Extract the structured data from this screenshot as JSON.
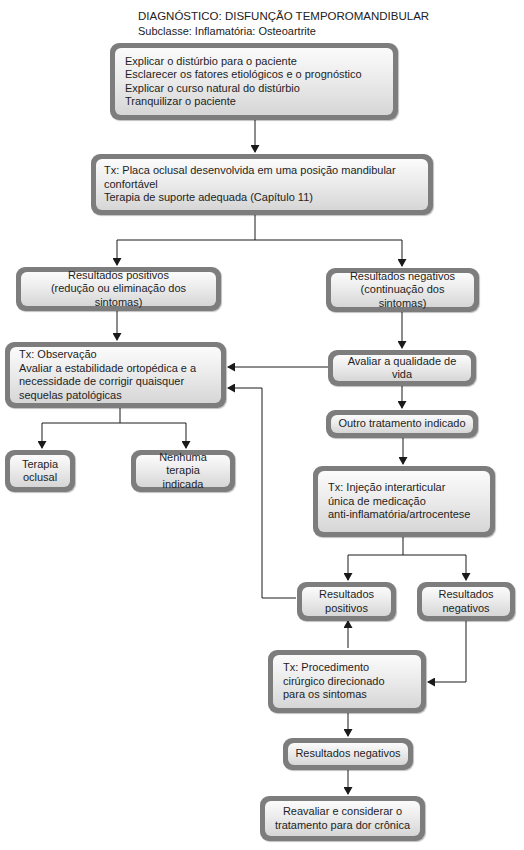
{
  "header": {
    "title": "DIAGNÓSTICO: DISFUNÇÃO TEMPOROMANDIBULAR",
    "subtitle": "Subclasse: Inflamatória: Osteoartrite"
  },
  "nodes": {
    "initial_steps": {
      "lines": [
        "Explicar o distúrbio para o paciente",
        "Esclarecer os fatores etiológicos e o prognóstico",
        "Explicar o curso natural do distúrbio",
        "Tranquilizar o paciente"
      ]
    },
    "tx_splint": {
      "lines": [
        "Tx: Placa oclusal desenvolvida em uma posição mandibular confortável",
        "Terapia de suporte adequada (Capítulo 11)"
      ]
    },
    "positive_results_1": {
      "lines": [
        "Resultados positivos",
        "(redução ou eliminação dos sintomas)"
      ]
    },
    "negative_results_1": {
      "lines": [
        "Resultados negativos",
        "(continuação dos sintomas)"
      ]
    },
    "tx_observation": {
      "lines": [
        "Tx: Observação",
        "Avaliar a estabilidade ortopédica e a",
        "necessidade de corrigir quaisquer",
        "sequelas patológicas"
      ]
    },
    "quality_of_life": {
      "lines": [
        "Avaliar a qualidade de vida"
      ]
    },
    "occlusal_therapy": {
      "lines": [
        "Terapia",
        "oclusal"
      ]
    },
    "no_therapy": {
      "lines": [
        "Nenhuma terapia",
        "indicada"
      ]
    },
    "other_treatment": {
      "lines": [
        "Outro tratamento indicado"
      ]
    },
    "tx_injection": {
      "lines": [
        "Tx: Injeção interarticular",
        "única de medicação",
        "anti-inflamatória/artrocentese"
      ]
    },
    "positive_results_2": {
      "lines": [
        "Resultados",
        "positivos"
      ]
    },
    "negative_results_2": {
      "lines": [
        "Resultados",
        "negativos"
      ]
    },
    "tx_surgery": {
      "lines": [
        "Tx: Procedimento",
        "cirúrgico direcionado",
        "para os sintomas"
      ]
    },
    "negative_results_3": {
      "lines": [
        "Resultados negativos"
      ]
    },
    "reevaluate": {
      "lines": [
        "Reavaliar e considerar o",
        "tratamento para dor crônica"
      ]
    }
  },
  "colors": {
    "box_border": "#7d7d7d",
    "box_fill_top": "#fbfbfb",
    "box_fill_bottom": "#d6d6d6",
    "line": "#1a1a1a"
  }
}
